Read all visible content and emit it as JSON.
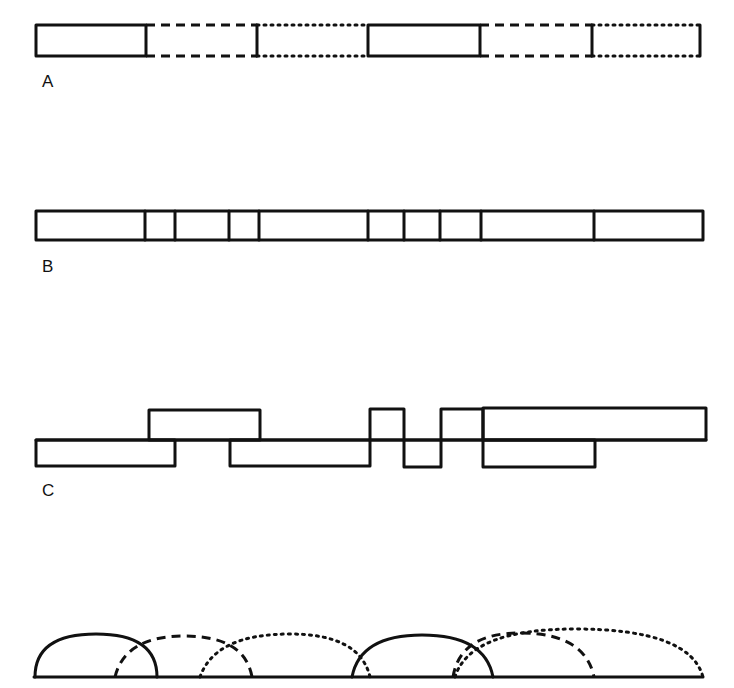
{
  "diagram": {
    "panels": [
      {
        "id": "A",
        "label": "A",
        "description": "Alternating solid, dashed, dotted segments in a single row"
      },
      {
        "id": "B",
        "label": "B",
        "description": "Single bar divided into cells of varying widths"
      },
      {
        "id": "C",
        "label": "C",
        "description": "Offset rectangles above and below a shared baseline"
      },
      {
        "id": "D",
        "label": "",
        "description": "Overlapping solid, dashed, dotted arcs on a baseline"
      }
    ],
    "colors": {
      "stroke": "#111111",
      "background": "#ffffff"
    },
    "rowA": {
      "segments": [
        {
          "style": "solid",
          "x1": 36,
          "x2": 146
        },
        {
          "style": "dashed",
          "x1": 146,
          "x2": 257
        },
        {
          "style": "dotted",
          "x1": 257,
          "x2": 368
        },
        {
          "style": "solid",
          "x1": 368,
          "x2": 480
        },
        {
          "style": "dashed",
          "x1": 480,
          "x2": 592
        },
        {
          "style": "dotted",
          "x1": 592,
          "x2": 700
        }
      ]
    },
    "rowB": {
      "x1": 36,
      "x2": 703,
      "dividers": [
        145,
        175,
        229,
        259,
        368,
        404,
        440,
        481,
        594
      ]
    },
    "rowC": {
      "upper": [
        [
          149,
          260
        ],
        [
          370,
          404
        ],
        [
          441,
          483
        ],
        [
          483,
          706
        ]
      ],
      "lower": [
        [
          36,
          175
        ],
        [
          230,
          370
        ],
        [
          404,
          441
        ],
        [
          483,
          595
        ]
      ]
    },
    "rowD": {
      "arcs": [
        {
          "style": "solid",
          "x1": 35,
          "x2": 157,
          "peak": 634
        },
        {
          "style": "dashed",
          "x1": 115,
          "x2": 252,
          "peak": 636
        },
        {
          "style": "dotted",
          "x1": 200,
          "x2": 370,
          "peak": 634
        },
        {
          "style": "solid",
          "x1": 352,
          "x2": 493,
          "peak": 635
        },
        {
          "style": "dashed",
          "x1": 453,
          "x2": 594,
          "peak": 633
        },
        {
          "style": "dotted",
          "x1": 455,
          "x2": 703,
          "peak": 629
        }
      ]
    }
  }
}
